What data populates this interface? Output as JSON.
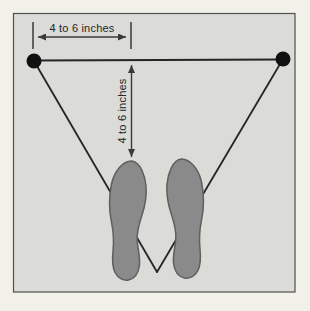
{
  "diagram": {
    "top_dimension_label": "4 to 6 inches",
    "side_dimension_label": "4 to 6 inches"
  },
  "icons": {
    "arrowhead": "triangle-arrowhead",
    "dots": "target-marker-dot",
    "feet": "footprint-sole"
  },
  "colors": {
    "page_background": "#f2f1e9",
    "panel_fill": "#dbdbd7",
    "panel_border": "#4f4f4f",
    "structure_line": "#262626",
    "dimension": "#3a3a3a",
    "label_text": "#262626",
    "dot_fill": "#111111",
    "foot_fill": "#8a8a8a",
    "foot_outline": "#5f5f5f"
  }
}
